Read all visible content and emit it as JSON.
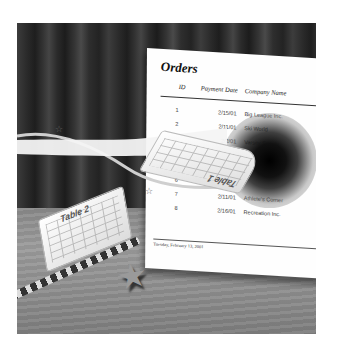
{
  "scene": {
    "description": "Illustration: orders report sheet on table with curtain backdrop, floating table sheets and magic wand"
  },
  "document": {
    "title": "Orders",
    "columns": [
      "ID",
      "Payment Date",
      "Company Name",
      "Payme."
    ],
    "rows": [
      {
        "id": "1",
        "date": "2/15/01",
        "company": "Big League Inc."
      },
      {
        "id": "2",
        "date": "2/11/01",
        "company": "Ski World"
      },
      {
        "id": "3",
        "date": "2/2/01",
        "company": "Varsity Supply"
      },
      {
        "id": "",
        "date": "",
        "company": ""
      },
      {
        "id": "5",
        "date": "",
        "company": ""
      },
      {
        "id": "6",
        "date": "",
        "company": ""
      },
      {
        "id": "7",
        "date": "2/11/01",
        "company": "Athlete's Corner"
      },
      {
        "id": "8",
        "date": "2/16/01",
        "company": "Recreation Inc."
      }
    ],
    "footer": "Tuesday, February 13, 2001"
  },
  "floating_sheets": [
    {
      "label": "Table 1"
    },
    {
      "label": "Table 2"
    }
  ],
  "decorations": {
    "star_glyph": "☆",
    "wand_star_glyph": "★"
  }
}
